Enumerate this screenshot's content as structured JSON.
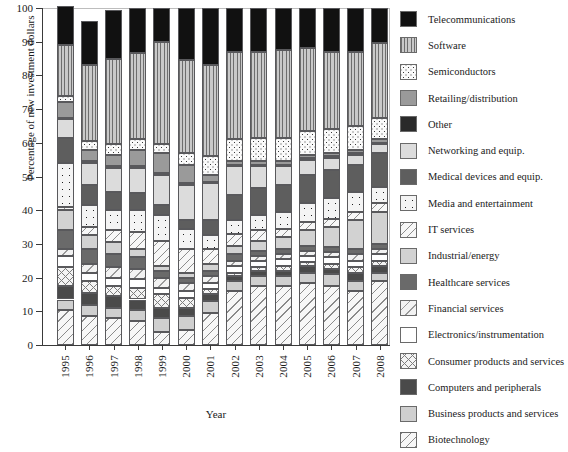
{
  "chart_data": {
    "type": "bar",
    "subtype": "stacked-percentage",
    "title": "",
    "xlabel": "Year",
    "ylabel": "Percentage of new investment dollars",
    "ylim": [
      0,
      100
    ],
    "ytick_labels": [
      "0",
      "10",
      "20",
      "30",
      "40",
      "50",
      "60",
      "70",
      "80",
      "90",
      "100"
    ],
    "yticks": [
      0,
      10,
      20,
      30,
      40,
      50,
      60,
      70,
      80,
      90,
      100
    ],
    "grid": false,
    "legend_position": "right",
    "categories": [
      "1995",
      "1996",
      "1997",
      "1998",
      "1999",
      "2000",
      "2001",
      "2002",
      "2003",
      "2004",
      "2005",
      "2006",
      "2007",
      "2008"
    ],
    "stack_order_bottom_to_top": [
      "Biotechnology",
      "Business products and services",
      "Computers and peripherals",
      "Consumer products and services",
      "Electronics/instrumentation",
      "Financial services",
      "Healthcare services",
      "Industrial/energy",
      "IT services",
      "Media and entertainment",
      "Medical devices and equip.",
      "Networking and equip.",
      "Other",
      "Retailing/distribution",
      "Semiconductors",
      "Software",
      "Telecommunications"
    ],
    "series": [
      {
        "name": "Biotechnology",
        "fill": "biotech",
        "values": [
          10.5,
          8.5,
          8.0,
          7.0,
          4.0,
          4.5,
          9.5,
          16.0,
          17.5,
          17.5,
          18.5,
          17.5,
          16.0,
          19.0
        ]
      },
      {
        "name": "Business products and services",
        "fill": "business",
        "values": [
          3.0,
          3.5,
          3.0,
          3.5,
          4.0,
          4.0,
          3.5,
          3.0,
          3.0,
          3.0,
          3.0,
          3.5,
          3.0,
          2.5
        ]
      },
      {
        "name": "Computers and peripherals",
        "fill": "computers",
        "values": [
          4.0,
          3.5,
          3.5,
          3.0,
          3.0,
          2.5,
          2.0,
          1.5,
          1.5,
          1.5,
          2.0,
          1.5,
          2.5,
          2.0
        ]
      },
      {
        "name": "Consumer products and services",
        "fill": "consumer",
        "values": [
          5.5,
          3.5,
          3.0,
          3.5,
          4.0,
          3.0,
          1.5,
          1.0,
          1.0,
          1.5,
          1.0,
          1.5,
          1.5,
          1.5
        ]
      },
      {
        "name": "Electronics/instrumentation",
        "fill": "electronics",
        "values": [
          3.5,
          2.5,
          2.5,
          2.5,
          2.0,
          2.0,
          2.0,
          2.0,
          2.0,
          2.0,
          2.0,
          2.0,
          2.0,
          2.0
        ]
      },
      {
        "name": "Financial services",
        "fill": "financial",
        "values": [
          2.0,
          2.5,
          3.0,
          3.0,
          3.0,
          2.5,
          2.0,
          1.5,
          1.5,
          1.5,
          1.5,
          1.5,
          2.0,
          1.5
        ]
      },
      {
        "name": "Healthcare services",
        "fill": "health",
        "values": [
          5.5,
          4.5,
          4.0,
          3.5,
          2.0,
          1.5,
          1.5,
          2.0,
          1.5,
          1.5,
          1.5,
          1.5,
          1.5,
          1.5
        ]
      },
      {
        "name": "Industrial/energy",
        "fill": "industrial",
        "values": [
          6.0,
          4.0,
          3.5,
          2.5,
          1.5,
          1.5,
          2.0,
          2.5,
          3.0,
          3.5,
          4.5,
          6.0,
          8.5,
          9.5
        ]
      },
      {
        "name": "IT services",
        "fill": "it",
        "values": [
          1.0,
          2.5,
          3.5,
          5.0,
          7.5,
          7.0,
          4.5,
          3.5,
          3.0,
          2.5,
          2.5,
          2.5,
          2.5,
          2.5
        ]
      },
      {
        "name": "Media and entertainment",
        "fill": "media",
        "values": [
          13.0,
          6.5,
          6.0,
          6.5,
          7.5,
          6.0,
          4.0,
          4.0,
          4.5,
          5.0,
          5.5,
          6.0,
          6.0,
          5.0
        ]
      },
      {
        "name": "Medical devices and equip.",
        "fill": "medical",
        "values": [
          7.5,
          6.0,
          5.5,
          5.0,
          3.0,
          2.5,
          4.5,
          7.5,
          8.0,
          8.0,
          8.5,
          8.5,
          8.0,
          10.0
        ]
      },
      {
        "name": "Networking and equip.",
        "fill": "network",
        "values": [
          5.5,
          6.5,
          7.0,
          7.5,
          9.0,
          10.5,
          11.0,
          8.5,
          6.5,
          5.5,
          4.5,
          3.5,
          3.0,
          2.5
        ]
      },
      {
        "name": "Other",
        "fill": "other",
        "values": [
          0.5,
          0.5,
          0.5,
          0.5,
          0.5,
          0.5,
          0.5,
          0.5,
          0.5,
          0.5,
          0.5,
          0.5,
          0.5,
          0.5
        ]
      },
      {
        "name": "Retailing/distribution",
        "fill": "retail",
        "values": [
          4.5,
          3.5,
          3.5,
          5.0,
          6.0,
          5.5,
          2.0,
          1.0,
          1.0,
          1.0,
          1.0,
          1.0,
          1.0,
          1.0
        ]
      },
      {
        "name": "Semiconductors",
        "fill": "semi",
        "values": [
          2.0,
          2.5,
          3.0,
          3.0,
          2.5,
          3.5,
          5.5,
          6.5,
          7.0,
          7.0,
          7.0,
          7.0,
          7.0,
          6.5
        ]
      },
      {
        "name": "Software",
        "fill": "software",
        "values": [
          15.0,
          22.5,
          25.5,
          25.5,
          30.5,
          27.5,
          27.0,
          26.0,
          25.5,
          26.0,
          24.5,
          23.0,
          22.0,
          22.0
        ]
      },
      {
        "name": "Telecommunications",
        "fill": "telecom",
        "values": [
          11.5,
          13.0,
          14.5,
          13.5,
          10.0,
          15.5,
          17.0,
          13.0,
          13.0,
          12.5,
          12.0,
          13.0,
          13.0,
          10.5
        ]
      }
    ]
  },
  "legend": {
    "items": [
      {
        "label": "Telecommunications",
        "fill": "telecom"
      },
      {
        "label": "Software",
        "fill": "software"
      },
      {
        "label": "Semiconductors",
        "fill": "semi"
      },
      {
        "label": "Retailing/distribution",
        "fill": "retail"
      },
      {
        "label": "Other",
        "fill": "other"
      },
      {
        "label": "Networking and equip.",
        "fill": "network"
      },
      {
        "label": "Medical devices and equip.",
        "fill": "medical"
      },
      {
        "label": "Media and entertainment",
        "fill": "media"
      },
      {
        "label": "IT services",
        "fill": "it"
      },
      {
        "label": "Industrial/energy",
        "fill": "industrial"
      },
      {
        "label": "Healthcare services",
        "fill": "health"
      },
      {
        "label": "Financial services",
        "fill": "financial"
      },
      {
        "label": "Electronics/instrumentation",
        "fill": "electronics"
      },
      {
        "label": "Consumer products and services",
        "fill": "consumer"
      },
      {
        "label": "Computers and peripherals",
        "fill": "computers"
      },
      {
        "label": "Business products and services",
        "fill": "business"
      },
      {
        "label": "Biotechnology",
        "fill": "biotech"
      }
    ]
  },
  "colors": {
    "axis": "#3a3a3a",
    "text": "#1a1a1a",
    "background": "#ffffff",
    "segment_border": "#59595c"
  }
}
